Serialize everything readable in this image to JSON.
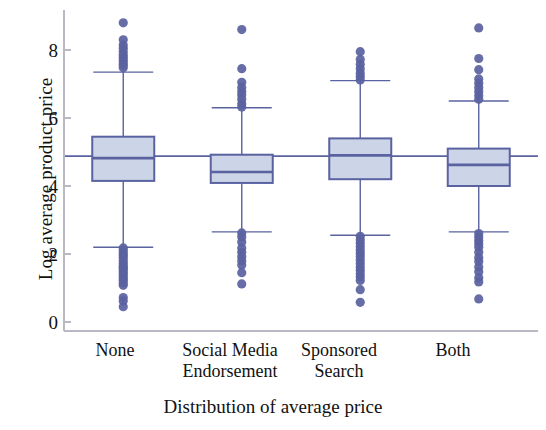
{
  "chart_data": {
    "type": "box",
    "title": "",
    "xlabel": "Distribution of average price",
    "ylabel": "Log average product price",
    "ylim": [
      -0.35,
      9.15
    ],
    "yticks": [
      0,
      2,
      4,
      6,
      8
    ],
    "ytick_labels": [
      "0",
      "2",
      "4",
      "6",
      "8"
    ],
    "grid": false,
    "legend": "none",
    "categories": [
      "None",
      "Social Media Endorsement",
      "Sponsored Search",
      "Both"
    ],
    "reference_line": {
      "name": "grand-mean-line",
      "value": 4.88,
      "orientation": "horizontal"
    },
    "boxes": [
      {
        "category": "None",
        "lower_whisker": 2.2,
        "q1": 4.15,
        "median": 4.82,
        "q3": 5.45,
        "upper_whisker": 7.35,
        "mean": 4.88,
        "outliers_high": [
          8.8,
          8.3,
          8.15,
          8.05,
          7.95,
          7.85,
          7.78,
          7.7,
          7.62,
          7.55,
          7.48
        ],
        "outliers_low": [
          2.18,
          2.1,
          2.02,
          1.95,
          1.88,
          1.8,
          1.72,
          1.65,
          1.6,
          1.55,
          1.48,
          1.42,
          1.35,
          1.28,
          1.22,
          1.15,
          1.08,
          0.72,
          0.62,
          0.45
        ]
      },
      {
        "category": "Social Media Endorsement",
        "lower_whisker": 2.65,
        "q1": 4.09,
        "median": 4.41,
        "q3": 4.92,
        "upper_whisker": 6.3,
        "mean": 4.88,
        "outliers_high": [
          8.6,
          7.45,
          7.05,
          6.9,
          6.78,
          6.68,
          6.55,
          6.42,
          6.32
        ],
        "outliers_low": [
          2.62,
          2.5,
          2.35,
          2.18,
          2.05,
          1.92,
          1.8,
          1.68,
          1.45,
          1.12
        ]
      },
      {
        "category": "Sponsored Search",
        "lower_whisker": 2.55,
        "q1": 4.2,
        "median": 4.9,
        "q3": 5.4,
        "upper_whisker": 7.1,
        "mean": 4.88,
        "outliers_high": [
          7.95,
          7.72,
          7.58,
          7.45,
          7.32,
          7.22,
          7.12
        ],
        "outliers_low": [
          2.52,
          2.42,
          2.32,
          2.22,
          2.12,
          2.02,
          1.92,
          1.82,
          1.72,
          1.62,
          1.52,
          1.42,
          1.32,
          1.22,
          0.95,
          0.58
        ]
      },
      {
        "category": "Both",
        "lower_whisker": 2.65,
        "q1": 4.0,
        "median": 4.62,
        "q3": 5.1,
        "upper_whisker": 6.5,
        "mean": 4.85,
        "outliers_high": [
          8.65,
          7.75,
          7.42,
          7.15,
          7.02,
          6.9,
          6.78,
          6.66,
          6.55
        ],
        "outliers_low": [
          2.6,
          2.5,
          2.4,
          2.3,
          2.2,
          2.05,
          1.9,
          1.78,
          1.62,
          1.48,
          1.3,
          1.18,
          0.68
        ]
      }
    ],
    "colors": {
      "box_fill": "#ccd4e8",
      "box_stroke": "#5a62a0",
      "outlier": "#5a62a0",
      "axis": "#b9b9c4",
      "reference_line": "#5a62a0",
      "text": "#111111"
    }
  },
  "axes": {
    "y": {
      "title": "Log average product price",
      "ticks": [
        {
          "label": "8"
        },
        {
          "label": "6"
        },
        {
          "label": "4"
        },
        {
          "label": "2"
        },
        {
          "label": "0"
        }
      ]
    },
    "x": {
      "title": "Distribution of average price",
      "ticks": [
        {
          "line1": "None",
          "line2": ""
        },
        {
          "line1": "Social Media",
          "line2": "Endorsement"
        },
        {
          "line1": "Sponsored",
          "line2": "Search"
        },
        {
          "line1": "Both",
          "line2": ""
        }
      ]
    }
  }
}
